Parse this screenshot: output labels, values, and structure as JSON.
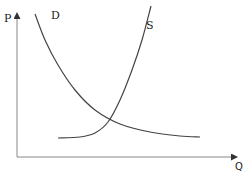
{
  "chart_data": {
    "type": "line",
    "title": "",
    "xlabel": "Q",
    "ylabel": "P",
    "grid": false,
    "legend": "none",
    "series": [
      {
        "name": "D",
        "label": "D",
        "description": "Demand curve, downward sloping and convex",
        "points": [
          [
            35,
            14
          ],
          [
            45,
            40
          ],
          [
            58,
            65
          ],
          [
            75,
            90
          ],
          [
            95,
            110
          ],
          [
            120,
            124
          ],
          [
            150,
            132
          ],
          [
            180,
            136
          ],
          [
            200,
            137
          ]
        ]
      },
      {
        "name": "S",
        "label": "S",
        "description": "Supply curve, flat then rising steeply",
        "points": [
          [
            58,
            138
          ],
          [
            80,
            137
          ],
          [
            95,
            133
          ],
          [
            108,
            122
          ],
          [
            120,
            100
          ],
          [
            132,
            70
          ],
          [
            142,
            40
          ],
          [
            151,
            6
          ]
        ]
      }
    ],
    "annotations": [
      "D",
      "S"
    ],
    "intersection": [
      104,
      122
    ]
  },
  "labels": {
    "y_axis": "P",
    "x_axis": "Q",
    "demand": "D",
    "supply": "S"
  }
}
